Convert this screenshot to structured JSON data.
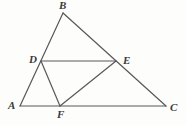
{
  "figure": {
    "width": 186,
    "height": 125,
    "background_color": "#fdfdfc",
    "stroke_color": "#58585a",
    "stroke_width": 1.2,
    "label_color": "#3a3a38"
  },
  "points": {
    "A": {
      "name": "A",
      "label": "A",
      "x": 20,
      "y": 106,
      "label_x": 8,
      "label_y": 100
    },
    "B": {
      "name": "B",
      "label": "B",
      "x": 63,
      "y": 13,
      "label_x": 59,
      "label_y": 0
    },
    "C": {
      "name": "C",
      "label": "C",
      "x": 166,
      "y": 106,
      "label_x": 170,
      "label_y": 102
    },
    "D": {
      "name": "D",
      "label": "D",
      "x": 41,
      "y": 61,
      "label_x": 29,
      "label_y": 54
    },
    "E": {
      "name": "E",
      "label": "E",
      "x": 116,
      "y": 61,
      "label_x": 123,
      "label_y": 55
    },
    "F": {
      "name": "F",
      "label": "F",
      "x": 60,
      "y": 106,
      "label_x": 57,
      "label_y": 109
    }
  },
  "segments": [
    {
      "name": "segment-AB",
      "from": "A",
      "to": "B",
      "label": "AB"
    },
    {
      "name": "segment-BC",
      "from": "B",
      "to": "C",
      "label": "BC"
    },
    {
      "name": "segment-AC",
      "from": "A",
      "to": "C",
      "label": "AC"
    },
    {
      "name": "segment-DE",
      "from": "D",
      "to": "E",
      "label": "DE"
    },
    {
      "name": "segment-DF",
      "from": "D",
      "to": "F",
      "label": "DF"
    },
    {
      "name": "segment-EF",
      "from": "E",
      "to": "F",
      "label": "EF"
    }
  ]
}
